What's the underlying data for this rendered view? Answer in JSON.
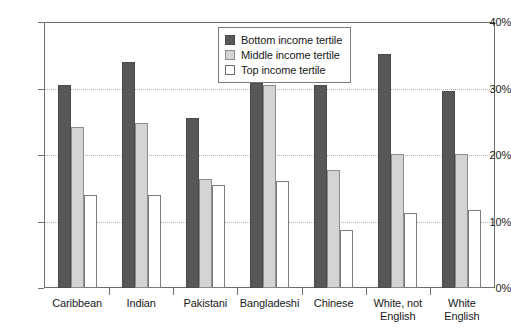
{
  "chart_data": {
    "type": "bar",
    "title": "",
    "xlabel": "",
    "ylabel": "",
    "ylim": [
      0,
      40
    ],
    "y_ticks": [
      "0%",
      "10%",
      "20%",
      "30%",
      "40%"
    ],
    "y_tick_values": [
      0,
      10,
      20,
      30,
      40
    ],
    "grid": true,
    "legend_position": "top-right",
    "categories": [
      "Caribbean",
      "Indian",
      "Pakistani",
      "Bangladeshi",
      "Chinese",
      "White, not\nEnglish",
      "White\nEnglish"
    ],
    "series": [
      {
        "name": "Bottom income tertile",
        "color": "#58585a",
        "values": [
          30.5,
          34.0,
          25.5,
          30.8,
          30.5,
          35.2,
          29.7
        ]
      },
      {
        "name": "Middle income tertile",
        "color": "#d4d4d4",
        "values": [
          24.2,
          24.8,
          16.4,
          30.6,
          17.7,
          20.2,
          20.2
        ]
      },
      {
        "name": "Top income tertile",
        "color": "#ffffff",
        "values": [
          14.0,
          14.0,
          15.5,
          16.1,
          8.7,
          11.3,
          11.8
        ]
      }
    ]
  },
  "axis": {
    "y_max_label": "40%",
    "y_min_label": "0%"
  },
  "colors": {
    "series_bottom": "#58585a",
    "series_middle": "#d4d4d4",
    "series_top": "#ffffff",
    "axis": "#6f6f6f",
    "gridline": "#b4b4b4"
  }
}
